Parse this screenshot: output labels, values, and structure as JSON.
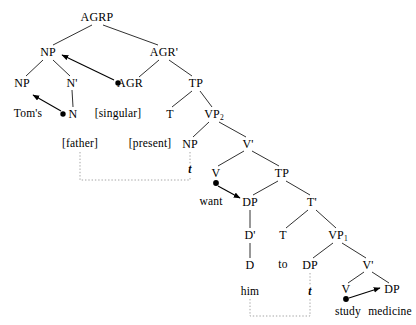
{
  "diagram": {
    "kind": "syntax-tree",
    "width": 416,
    "height": 325,
    "ink_color": "#000000",
    "background_color": "#ffffff",
    "trace_line_color": "#999999"
  },
  "nodes": [
    {
      "id": "agrp",
      "label": "AGRP",
      "x": 97,
      "y": 17,
      "type": "category"
    },
    {
      "id": "np_top",
      "label": "NP",
      "x": 48,
      "y": 52,
      "type": "category"
    },
    {
      "id": "agr_bar",
      "label": "AGR'",
      "x": 164,
      "y": 52,
      "type": "category"
    },
    {
      "id": "np_low",
      "label": "NP",
      "x": 22,
      "y": 83,
      "type": "category"
    },
    {
      "id": "n_bar",
      "label": "N'",
      "x": 72,
      "y": 83,
      "type": "category"
    },
    {
      "id": "agr",
      "label": "AGR",
      "x": 130,
      "y": 83,
      "type": "category"
    },
    {
      "id": "tp_top",
      "label": "TP",
      "x": 196,
      "y": 83,
      "type": "category"
    },
    {
      "id": "toms",
      "label": "Tom's",
      "x": 28,
      "y": 114,
      "type": "word"
    },
    {
      "id": "n",
      "label": "N",
      "x": 73,
      "y": 114,
      "type": "category"
    },
    {
      "id": "singular",
      "label": "[singular]",
      "x": 118,
      "y": 114,
      "type": "feature"
    },
    {
      "id": "t_top",
      "label": "T",
      "x": 170,
      "y": 114,
      "type": "category"
    },
    {
      "id": "vp2",
      "label": "VP",
      "sub": "2",
      "x": 214,
      "y": 114,
      "type": "category"
    },
    {
      "id": "father",
      "label": "[father]",
      "x": 80,
      "y": 144,
      "type": "feature"
    },
    {
      "id": "present",
      "label": "[present]",
      "x": 150,
      "y": 144,
      "type": "feature"
    },
    {
      "id": "np_sub",
      "label": "NP",
      "x": 190,
      "y": 144,
      "type": "category"
    },
    {
      "id": "v_bar2",
      "label": "V'",
      "x": 248,
      "y": 144,
      "type": "category"
    },
    {
      "id": "trace1",
      "label": "t",
      "x": 190,
      "y": 170,
      "type": "trace"
    },
    {
      "id": "v2",
      "label": "V",
      "x": 216,
      "y": 173,
      "type": "category"
    },
    {
      "id": "tp_mid",
      "label": "TP",
      "x": 282,
      "y": 173,
      "type": "category"
    },
    {
      "id": "want",
      "label": "want",
      "x": 211,
      "y": 202,
      "type": "word"
    },
    {
      "id": "dp_obj",
      "label": "DP",
      "x": 250,
      "y": 202,
      "type": "category"
    },
    {
      "id": "t_bar",
      "label": "T'",
      "x": 312,
      "y": 202,
      "type": "category"
    },
    {
      "id": "d_bar",
      "label": "D'",
      "x": 250,
      "y": 235,
      "type": "category"
    },
    {
      "id": "t_mid",
      "label": "T",
      "x": 283,
      "y": 235,
      "type": "category"
    },
    {
      "id": "vp1",
      "label": "VP",
      "sub": "1",
      "x": 338,
      "y": 235,
      "type": "category"
    },
    {
      "id": "d",
      "label": "D",
      "x": 250,
      "y": 265,
      "type": "category"
    },
    {
      "id": "to",
      "label": "to",
      "x": 283,
      "y": 265,
      "type": "word"
    },
    {
      "id": "dp_sub",
      "label": "DP",
      "x": 310,
      "y": 265,
      "type": "category"
    },
    {
      "id": "v_bar1",
      "label": "V'",
      "x": 368,
      "y": 265,
      "type": "category"
    },
    {
      "id": "him",
      "label": "him",
      "x": 250,
      "y": 292,
      "type": "word"
    },
    {
      "id": "trace2",
      "label": "t",
      "x": 310,
      "y": 292,
      "type": "trace"
    },
    {
      "id": "v1",
      "label": "V",
      "x": 346,
      "y": 289,
      "type": "category"
    },
    {
      "id": "dp_med",
      "label": "DP",
      "x": 392,
      "y": 289,
      "type": "category"
    },
    {
      "id": "study",
      "label": "study",
      "x": 348,
      "y": 312,
      "type": "word"
    },
    {
      "id": "medicine",
      "label": "medicine",
      "x": 390,
      "y": 312,
      "type": "word"
    }
  ],
  "branches": [
    {
      "from": "agrp",
      "to": "np_top"
    },
    {
      "from": "agrp",
      "to": "agr_bar"
    },
    {
      "from": "np_top",
      "to": "np_low"
    },
    {
      "from": "np_top",
      "to": "n_bar"
    },
    {
      "from": "agr_bar",
      "to": "agr"
    },
    {
      "from": "agr_bar",
      "to": "tp_top"
    },
    {
      "from": "n_bar",
      "to": "n"
    },
    {
      "from": "tp_top",
      "to": "t_top"
    },
    {
      "from": "tp_top",
      "to": "vp2"
    },
    {
      "from": "vp2",
      "to": "np_sub"
    },
    {
      "from": "vp2",
      "to": "v_bar2"
    },
    {
      "from": "v_bar2",
      "to": "v2"
    },
    {
      "from": "v_bar2",
      "to": "tp_mid"
    },
    {
      "from": "tp_mid",
      "to": "dp_obj"
    },
    {
      "from": "tp_mid",
      "to": "t_bar"
    },
    {
      "from": "t_bar",
      "to": "t_mid"
    },
    {
      "from": "t_bar",
      "to": "vp1"
    },
    {
      "from": "dp_obj",
      "to": "d_bar"
    },
    {
      "from": "d_bar",
      "to": "d"
    },
    {
      "from": "vp1",
      "to": "dp_sub"
    },
    {
      "from": "vp1",
      "to": "v_bar1"
    },
    {
      "from": "v_bar1",
      "to": "v1"
    },
    {
      "from": "v_bar1",
      "to": "dp_med"
    }
  ],
  "movement_arrows": [
    {
      "id": "arrow-n-to-np",
      "from": "N-bullet",
      "to": "NP",
      "label": "head movement N to NP"
    },
    {
      "id": "arrow-agr-to-np",
      "from": "AGR-bullet",
      "to": "NP",
      "label": "AGR to NP specifier"
    },
    {
      "id": "arrow-want-to-dp",
      "from": "V-bullet",
      "to": "DP",
      "label": "V want to DP"
    },
    {
      "id": "arrow-study-to-dp",
      "from": "V-bullet",
      "to": "DP",
      "label": "V study to DP medicine"
    }
  ],
  "trace_links": [
    {
      "id": "trace-link-father",
      "from": "[father]",
      "to": "t",
      "label": "father trace chain"
    },
    {
      "id": "trace-link-him",
      "from": "him",
      "to": "t",
      "label": "him trace chain"
    }
  ],
  "sentence": {
    "words": [
      "Tom's",
      "father",
      "present",
      "want",
      "him",
      "to",
      "study",
      "medicine"
    ]
  }
}
